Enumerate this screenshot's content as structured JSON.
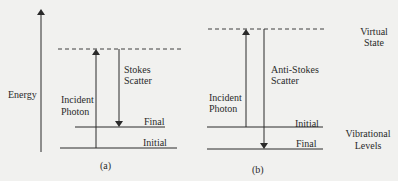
{
  "axis": {
    "label": "Energy"
  },
  "panel_a": {
    "caption": "(a)",
    "incident_label_line1": "Incident",
    "incident_label_line2": "Photon",
    "scatter_label_line1": "Stokes",
    "scatter_label_line2": "Scatter",
    "upper_level": "Final",
    "lower_level": "Initial"
  },
  "panel_b": {
    "caption": "(b)",
    "incident_label_line1": "Incident",
    "incident_label_line2": "Photon",
    "scatter_label_line1": "Anti-Stokes",
    "scatter_label_line2": "Scatter",
    "upper_level": "Initial",
    "lower_level": "Final"
  },
  "side_labels": {
    "virtual_line1": "Virtual",
    "virtual_line2": "State",
    "vibrational_line1": "Vibrational",
    "vibrational_line2": "Levels"
  },
  "colors": {
    "line": "#2a2a2a",
    "background": "#f1f1ef"
  }
}
